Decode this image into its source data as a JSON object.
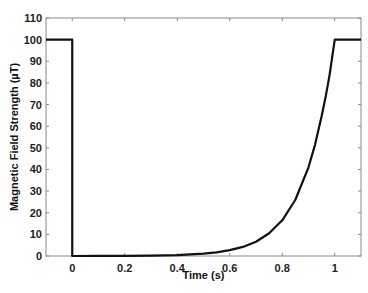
{
  "chart_data": {
    "type": "line",
    "title": "",
    "xlabel": "Time (s)",
    "ylabel": "Magnetic Field Strength (µT)",
    "xlim": [
      -0.1,
      1.1
    ],
    "ylim": [
      0,
      110
    ],
    "xticks": [
      0,
      0.2,
      0.4,
      0.6,
      0.8,
      1
    ],
    "xtick_labels": [
      "0",
      "0.2",
      "0.4",
      "0.6",
      "0.8",
      "1"
    ],
    "yticks": [
      0,
      10,
      20,
      30,
      40,
      50,
      60,
      70,
      80,
      90,
      100,
      110
    ],
    "ytick_labels": [
      "0",
      "10",
      "20",
      "30",
      "40",
      "50",
      "60",
      "70",
      "80",
      "90",
      "100",
      "110"
    ],
    "grid": false,
    "legend": null,
    "series": [
      {
        "name": "field",
        "color": "#111111",
        "x": [
          -0.1,
          0,
          0,
          0.1,
          0.2,
          0.3,
          0.4,
          0.5,
          0.55,
          0.6,
          0.65,
          0.7,
          0.75,
          0.8,
          0.85,
          0.9,
          0.925,
          0.95,
          0.966,
          0.98,
          1.0,
          1.1
        ],
        "y": [
          100,
          100,
          0,
          0.02,
          0.06,
          0.17,
          0.44,
          1.1,
          1.7,
          2.7,
          4.2,
          6.6,
          10.5,
          16.5,
          26,
          41,
          51.5,
          64.6,
          74,
          83.5,
          100,
          100
        ]
      }
    ]
  }
}
